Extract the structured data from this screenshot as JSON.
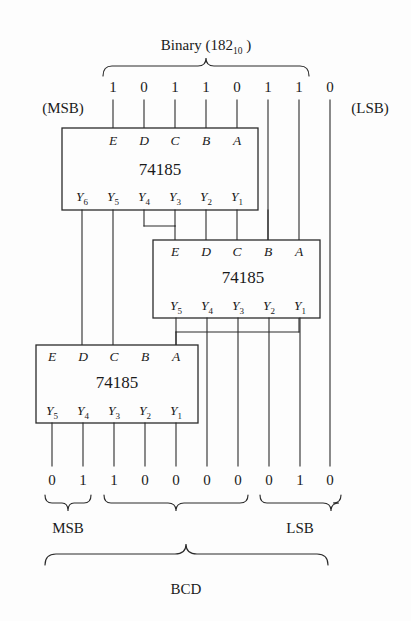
{
  "figure": {
    "title_prefix": "Binary (182",
    "title_sub": "10",
    "title_suffix": " )",
    "msb_label": "(MSB)",
    "lsb_label": "(LSB)",
    "bottom_group_labels": {
      "msb": "MSB",
      "lsb": "LSB",
      "overall": "BCD"
    }
  },
  "binary_input": {
    "value_decimal": "182",
    "bits": [
      "1",
      "0",
      "1",
      "1",
      "0",
      "1",
      "1",
      "0"
    ]
  },
  "bcd_output": {
    "bits": [
      "0",
      "1",
      "1",
      "0",
      "0",
      "0",
      "0",
      "0",
      "1",
      "0"
    ],
    "groups": [
      {
        "label": "MSB",
        "bits": [
          "0",
          "1"
        ]
      },
      {
        "label": "",
        "bits": [
          "1",
          "0",
          "0",
          "0"
        ]
      },
      {
        "label": "LSB",
        "bits": [
          "0",
          "0",
          "1",
          "0"
        ]
      }
    ]
  },
  "chips": [
    {
      "name": "74185",
      "inputs": [
        "E",
        "D",
        "C",
        "B",
        "A"
      ],
      "outputs": [
        {
          "base": "Y",
          "sub": "6"
        },
        {
          "base": "Y",
          "sub": "5"
        },
        {
          "base": "Y",
          "sub": "4"
        },
        {
          "base": "Y",
          "sub": "3"
        },
        {
          "base": "Y",
          "sub": "2"
        },
        {
          "base": "Y",
          "sub": "1"
        }
      ]
    },
    {
      "name": "74185",
      "inputs": [
        "E",
        "D",
        "C",
        "B",
        "A"
      ],
      "outputs": [
        {
          "base": "Y",
          "sub": "5"
        },
        {
          "base": "Y",
          "sub": "4"
        },
        {
          "base": "Y",
          "sub": "3"
        },
        {
          "base": "Y",
          "sub": "2"
        },
        {
          "base": "Y",
          "sub": "1"
        }
      ]
    },
    {
      "name": "74185",
      "inputs": [
        "E",
        "D",
        "C",
        "B",
        "A"
      ],
      "outputs": [
        {
          "base": "Y",
          "sub": "5"
        },
        {
          "base": "Y",
          "sub": "4"
        },
        {
          "base": "Y",
          "sub": "3"
        },
        {
          "base": "Y",
          "sub": "2"
        },
        {
          "base": "Y",
          "sub": "1"
        }
      ]
    }
  ],
  "colors": {
    "ink": "#1a1a1a",
    "line": "#2b2b2b",
    "paper": "#fdfdfd"
  }
}
